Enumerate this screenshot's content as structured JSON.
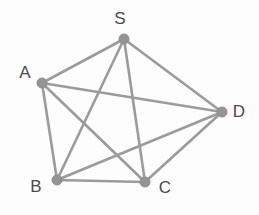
{
  "figure": {
    "background_color": "#fdfdfd",
    "edge_color": "#9b9b9b",
    "node_color": "#949494",
    "label_color": "#4a4a4a",
    "width": 259,
    "height": 215
  },
  "chart_data": {
    "type": "diagram",
    "graph_type": "complete-graph",
    "title": "",
    "nodes": [
      {
        "id": "S",
        "label": "S",
        "x": 124,
        "y": 39,
        "label_x": 120,
        "label_y": 20,
        "degree": 4
      },
      {
        "id": "A",
        "label": "A",
        "x": 42,
        "y": 83,
        "label_x": 25,
        "label_y": 74,
        "degree": 4
      },
      {
        "id": "D",
        "label": "D",
        "x": 222,
        "y": 112,
        "label_x": 239,
        "label_y": 113,
        "degree": 4
      },
      {
        "id": "B",
        "label": "B",
        "x": 57,
        "y": 180,
        "label_x": 36,
        "label_y": 188,
        "degree": 4
      },
      {
        "id": "C",
        "label": "C",
        "x": 145,
        "y": 182,
        "label_x": 165,
        "label_y": 189,
        "degree": 4
      }
    ],
    "edges": [
      {
        "from": "S",
        "to": "A"
      },
      {
        "from": "S",
        "to": "B"
      },
      {
        "from": "S",
        "to": "C"
      },
      {
        "from": "S",
        "to": "D"
      },
      {
        "from": "A",
        "to": "B"
      },
      {
        "from": "A",
        "to": "C"
      },
      {
        "from": "A",
        "to": "D"
      },
      {
        "from": "B",
        "to": "C"
      },
      {
        "from": "B",
        "to": "D"
      },
      {
        "from": "C",
        "to": "D"
      }
    ],
    "node_radius": 5,
    "edge_count": 10,
    "node_count": 5,
    "directed": false,
    "legend": [],
    "annotations": []
  }
}
